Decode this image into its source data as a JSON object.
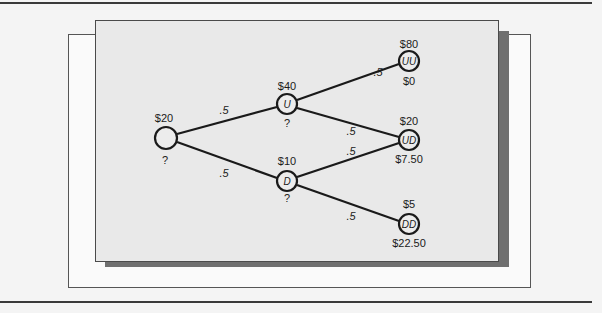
{
  "diagram": {
    "type": "binomial-tree",
    "nodes": {
      "root": {
        "id": "",
        "price": "$20",
        "value": "?"
      },
      "u": {
        "id": "U",
        "price": "$40",
        "value": "?"
      },
      "d": {
        "id": "D",
        "price": "$10",
        "value": "?"
      },
      "uu": {
        "id": "UU",
        "price": "$80",
        "value": "$0"
      },
      "ud": {
        "id": "UD",
        "price": "$20",
        "value": "$7.50"
      },
      "dd": {
        "id": "DD",
        "price": "$5",
        "value": "$22.50"
      }
    },
    "edges": [
      {
        "from": "root",
        "to": "u",
        "prob": ".5"
      },
      {
        "from": "root",
        "to": "d",
        "prob": ".5"
      },
      {
        "from": "u",
        "to": "uu",
        "prob": ".5"
      },
      {
        "from": "u",
        "to": "ud",
        "prob": ".5"
      },
      {
        "from": "d",
        "to": "ud",
        "prob": ".5"
      },
      {
        "from": "d",
        "to": "dd",
        "prob": ".5"
      }
    ]
  },
  "colors": {
    "panel": "#e9e9e9",
    "shadow": "#6f6f6f",
    "line": "#1a1a1a"
  }
}
